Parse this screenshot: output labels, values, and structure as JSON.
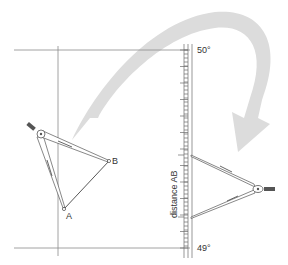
{
  "diagram": {
    "points": {
      "A": {
        "label": "A",
        "x": 64,
        "y": 209
      },
      "B": {
        "label": "B",
        "x": 109,
        "y": 161
      }
    },
    "latitude_scale": {
      "top_label": "50°",
      "bottom_label": "49°",
      "measure_label": "distance AB"
    },
    "arrow": {
      "meaning": "transfer divider span from chart to latitude scale",
      "color": "#d9d9d9"
    },
    "colors": {
      "line": "#7a7a7a",
      "divider": "#555555",
      "arrow": "#d9d9d9",
      "text": "#333333"
    }
  }
}
